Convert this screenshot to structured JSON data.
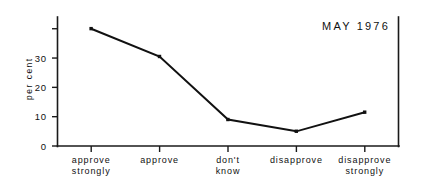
{
  "chart_data": {
    "type": "line",
    "title": "MAY 1976",
    "xlabel": "",
    "ylabel": "per cent",
    "categories": [
      "approve\nstrongly",
      "approve",
      "don't\nknow",
      "disapprove",
      "disapprove\nstrongly"
    ],
    "category_lines": [
      [
        "approve",
        "strongly"
      ],
      [
        "approve",
        ""
      ],
      [
        "don't",
        "know"
      ],
      [
        "disapprove",
        ""
      ],
      [
        "disapprove",
        "strongly"
      ]
    ],
    "values": [
      40,
      30.5,
      9,
      5,
      11.5
    ],
    "ylim": [
      0,
      44
    ],
    "yticks": [
      0,
      10,
      20,
      30,
      40
    ],
    "ytick_labels": [
      "0",
      "10",
      "20",
      "30",
      ""
    ],
    "grid": false,
    "legend": "none",
    "marker": "square",
    "line_color": "#111111",
    "marker_color": "#111111",
    "axis_color": "#1a1a1a",
    "background_color": "#ffffff"
  },
  "figure": {
    "title_position": "top-right",
    "plot_left_px": 57,
    "plot_right_px": 399,
    "plot_top_px": 17,
    "plot_bottom_px": 146
  }
}
